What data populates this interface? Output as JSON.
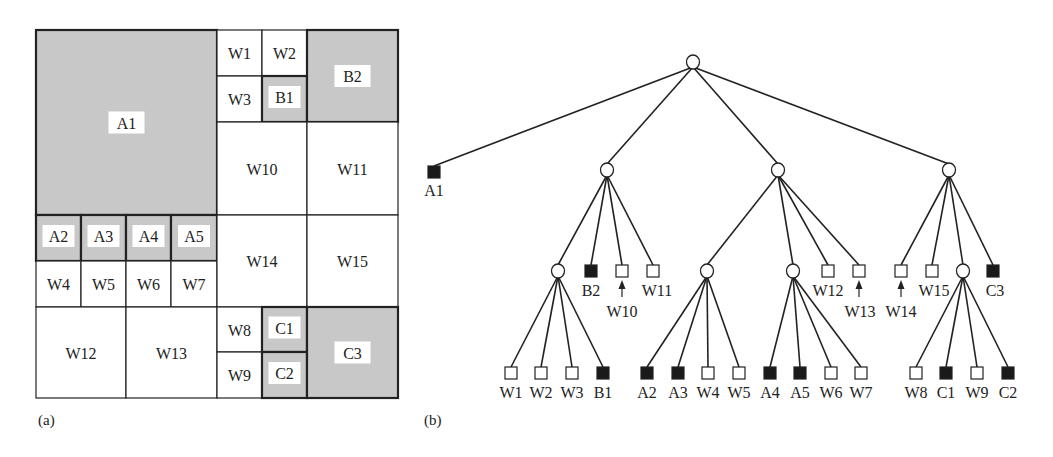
{
  "panel_a": {
    "caption": "(a)",
    "colors": {
      "occupied": "#c8c8c8",
      "free": "#ffffff",
      "border": "#222222"
    },
    "cells": [
      {
        "id": "A1",
        "x": 36,
        "y": 30,
        "w": 181,
        "h": 185,
        "filled": true
      },
      {
        "id": "W1",
        "x": 217,
        "y": 30,
        "w": 45,
        "h": 46,
        "filled": false
      },
      {
        "id": "W2",
        "x": 262,
        "y": 30,
        "w": 45,
        "h": 46,
        "filled": false
      },
      {
        "id": "W3",
        "x": 217,
        "y": 76,
        "w": 45,
        "h": 46,
        "filled": false
      },
      {
        "id": "B1",
        "x": 262,
        "y": 76,
        "w": 45,
        "h": 46,
        "filled": true
      },
      {
        "id": "B2",
        "x": 307,
        "y": 30,
        "w": 91,
        "h": 92,
        "filled": true
      },
      {
        "id": "W10",
        "x": 217,
        "y": 122,
        "w": 90,
        "h": 93,
        "filled": false
      },
      {
        "id": "W11",
        "x": 307,
        "y": 122,
        "w": 91,
        "h": 93,
        "filled": false
      },
      {
        "id": "A2",
        "x": 36,
        "y": 215,
        "w": 45,
        "h": 46,
        "filled": true
      },
      {
        "id": "A3",
        "x": 81,
        "y": 215,
        "w": 45,
        "h": 46,
        "filled": true
      },
      {
        "id": "A4",
        "x": 126,
        "y": 215,
        "w": 45,
        "h": 46,
        "filled": true
      },
      {
        "id": "A5",
        "x": 171,
        "y": 215,
        "w": 46,
        "h": 46,
        "filled": true
      },
      {
        "id": "W4",
        "x": 36,
        "y": 261,
        "w": 45,
        "h": 46,
        "filled": false
      },
      {
        "id": "W5",
        "x": 81,
        "y": 261,
        "w": 45,
        "h": 46,
        "filled": false
      },
      {
        "id": "W6",
        "x": 126,
        "y": 261,
        "w": 45,
        "h": 46,
        "filled": false
      },
      {
        "id": "W7",
        "x": 171,
        "y": 261,
        "w": 46,
        "h": 46,
        "filled": false
      },
      {
        "id": "W14",
        "x": 217,
        "y": 215,
        "w": 90,
        "h": 92,
        "filled": false
      },
      {
        "id": "W15",
        "x": 307,
        "y": 215,
        "w": 91,
        "h": 92,
        "filled": false
      },
      {
        "id": "W12",
        "x": 36,
        "y": 307,
        "w": 90,
        "h": 91,
        "filled": false
      },
      {
        "id": "W13",
        "x": 126,
        "y": 307,
        "w": 91,
        "h": 91,
        "filled": false
      },
      {
        "id": "W8",
        "x": 217,
        "y": 307,
        "w": 45,
        "h": 45,
        "filled": false
      },
      {
        "id": "C1",
        "x": 262,
        "y": 307,
        "w": 45,
        "h": 45,
        "filled": true
      },
      {
        "id": "W9",
        "x": 217,
        "y": 352,
        "w": 45,
        "h": 46,
        "filled": false
      },
      {
        "id": "C2",
        "x": 262,
        "y": 352,
        "w": 45,
        "h": 46,
        "filled": true
      },
      {
        "id": "C3",
        "x": 307,
        "y": 307,
        "w": 91,
        "h": 91,
        "filled": true
      }
    ]
  },
  "panel_b": {
    "caption": "(b)",
    "nodes": [
      {
        "id": "root",
        "type": "internal",
        "x": 693,
        "y": 62
      },
      {
        "id": "A1",
        "type": "occupied",
        "x": 434,
        "y": 172,
        "label": "A1",
        "lx": 434,
        "ly": 196
      },
      {
        "id": "n1",
        "type": "internal",
        "x": 607,
        "y": 170
      },
      {
        "id": "n2",
        "type": "internal",
        "x": 778,
        "y": 170
      },
      {
        "id": "n3",
        "type": "internal",
        "x": 949,
        "y": 170
      },
      {
        "id": "n11",
        "type": "internal",
        "x": 558,
        "y": 271
      },
      {
        "id": "B2",
        "type": "occupied",
        "x": 591,
        "y": 271,
        "label": "B2",
        "lx": 591,
        "ly": 296
      },
      {
        "id": "W10",
        "type": "free",
        "x": 622,
        "y": 271,
        "label": "W10",
        "lx": 622,
        "ly": 317,
        "arrow": true
      },
      {
        "id": "W11",
        "type": "free",
        "x": 653,
        "y": 271,
        "label": "W11",
        "lx": 657,
        "ly": 296
      },
      {
        "id": "n21",
        "type": "internal",
        "x": 707,
        "y": 271
      },
      {
        "id": "n22",
        "type": "internal",
        "x": 793,
        "y": 271
      },
      {
        "id": "W12",
        "type": "free",
        "x": 828,
        "y": 271,
        "label": "W12",
        "lx": 828,
        "ly": 296
      },
      {
        "id": "W13",
        "type": "free",
        "x": 859,
        "y": 271,
        "label": "W13",
        "lx": 860,
        "ly": 317,
        "arrow": true
      },
      {
        "id": "W14",
        "type": "free",
        "x": 901,
        "y": 271,
        "label": "W14",
        "lx": 901,
        "ly": 317,
        "arrow": true
      },
      {
        "id": "W15",
        "type": "free",
        "x": 932,
        "y": 271,
        "label": "W15",
        "lx": 934,
        "ly": 296
      },
      {
        "id": "n31",
        "type": "internal",
        "x": 963,
        "y": 271
      },
      {
        "id": "C3",
        "type": "occupied",
        "x": 993,
        "y": 271,
        "label": "C3",
        "lx": 995,
        "ly": 296
      },
      {
        "id": "W1",
        "type": "free",
        "x": 511,
        "y": 373,
        "label": "W1",
        "lx": 511,
        "ly": 398
      },
      {
        "id": "W2",
        "type": "free",
        "x": 541,
        "y": 373,
        "label": "W2",
        "lx": 541,
        "ly": 398
      },
      {
        "id": "W3",
        "type": "free",
        "x": 572,
        "y": 373,
        "label": "W3",
        "lx": 572,
        "ly": 398
      },
      {
        "id": "B1",
        "type": "occupied",
        "x": 603,
        "y": 373,
        "label": "B1",
        "lx": 603,
        "ly": 398
      },
      {
        "id": "A2",
        "type": "occupied",
        "x": 647,
        "y": 373,
        "label": "A2",
        "lx": 647,
        "ly": 398
      },
      {
        "id": "A3",
        "type": "occupied",
        "x": 678,
        "y": 373,
        "label": "A3",
        "lx": 678,
        "ly": 398
      },
      {
        "id": "W4",
        "type": "free",
        "x": 708,
        "y": 373,
        "label": "W4",
        "lx": 708,
        "ly": 398
      },
      {
        "id": "W5",
        "type": "free",
        "x": 739,
        "y": 373,
        "label": "W5",
        "lx": 739,
        "ly": 398
      },
      {
        "id": "A4",
        "type": "occupied",
        "x": 770,
        "y": 373,
        "label": "A4",
        "lx": 770,
        "ly": 398
      },
      {
        "id": "A5",
        "type": "occupied",
        "x": 800,
        "y": 373,
        "label": "A5",
        "lx": 800,
        "ly": 398
      },
      {
        "id": "W6",
        "type": "free",
        "x": 831,
        "y": 373,
        "label": "W6",
        "lx": 831,
        "ly": 398
      },
      {
        "id": "W7",
        "type": "free",
        "x": 861,
        "y": 373,
        "label": "W7",
        "lx": 861,
        "ly": 398
      },
      {
        "id": "W8",
        "type": "free",
        "x": 916,
        "y": 373,
        "label": "W8",
        "lx": 916,
        "ly": 398
      },
      {
        "id": "C1",
        "type": "occupied",
        "x": 946,
        "y": 373,
        "label": "C1",
        "lx": 946,
        "ly": 398
      },
      {
        "id": "W9",
        "type": "free",
        "x": 977,
        "y": 373,
        "label": "W9",
        "lx": 977,
        "ly": 398
      },
      {
        "id": "C2",
        "type": "occupied",
        "x": 1008,
        "y": 373,
        "label": "C2",
        "lx": 1008,
        "ly": 398
      }
    ],
    "edges": [
      [
        "root",
        "A1"
      ],
      [
        "root",
        "n1"
      ],
      [
        "root",
        "n2"
      ],
      [
        "root",
        "n3"
      ],
      [
        "n1",
        "n11"
      ],
      [
        "n1",
        "B2"
      ],
      [
        "n1",
        "W10"
      ],
      [
        "n1",
        "W11"
      ],
      [
        "n2",
        "n21"
      ],
      [
        "n2",
        "n22"
      ],
      [
        "n2",
        "W12"
      ],
      [
        "n2",
        "W13"
      ],
      [
        "n3",
        "W14"
      ],
      [
        "n3",
        "W15"
      ],
      [
        "n3",
        "n31"
      ],
      [
        "n3",
        "C3"
      ],
      [
        "n11",
        "W1"
      ],
      [
        "n11",
        "W2"
      ],
      [
        "n11",
        "W3"
      ],
      [
        "n11",
        "B1"
      ],
      [
        "n21",
        "A2"
      ],
      [
        "n21",
        "A3"
      ],
      [
        "n21",
        "W4"
      ],
      [
        "n21",
        "W5"
      ],
      [
        "n22",
        "A4"
      ],
      [
        "n22",
        "A5"
      ],
      [
        "n22",
        "W6"
      ],
      [
        "n22",
        "W7"
      ],
      [
        "n31",
        "W8"
      ],
      [
        "n31",
        "C1"
      ],
      [
        "n31",
        "W9"
      ],
      [
        "n31",
        "C2"
      ]
    ]
  }
}
